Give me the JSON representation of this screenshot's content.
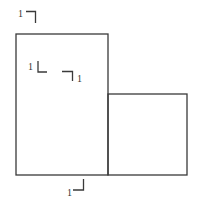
{
  "diagram": {
    "shapes": [
      {
        "id": "tall-rectangle",
        "x": 16,
        "y": 34,
        "width": 92,
        "height": 141
      },
      {
        "id": "small-square",
        "x": 108,
        "y": 94,
        "width": 79,
        "height": 81
      }
    ],
    "marks": [
      {
        "id": "mark-top",
        "label": "1"
      },
      {
        "id": "mark-mid-left",
        "label": "1"
      },
      {
        "id": "mark-mid-right",
        "label": "1"
      },
      {
        "id": "mark-bottom",
        "label": "1"
      }
    ],
    "colors": {
      "stroke": "#3a3a3a",
      "background": "#ffffff"
    }
  }
}
